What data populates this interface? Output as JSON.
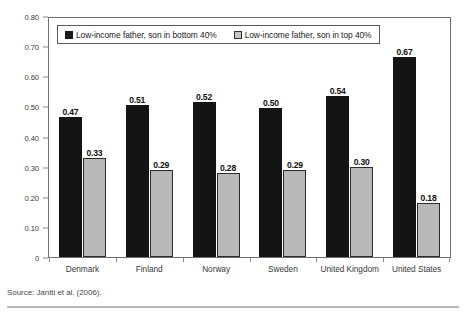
{
  "chart_data": {
    "type": "bar",
    "title": "",
    "subtitle": "",
    "xlabel": "",
    "ylabel": "",
    "categories": [
      "Denmark",
      "Finland",
      "Norway",
      "Sweden",
      "United Kingdom",
      "United States"
    ],
    "series": [
      {
        "name": "Low-income father, son in bottom 40%",
        "color": "#141414",
        "values": [
          0.47,
          0.51,
          0.52,
          0.5,
          0.54,
          0.67
        ],
        "labels": [
          "0.47",
          "0.51",
          "0.52",
          "0.50",
          "0.54",
          "0.67"
        ]
      },
      {
        "name": "Low-income father, son in top 40%",
        "color": "#b8b8b8",
        "values": [
          0.33,
          0.29,
          0.28,
          0.29,
          0.3,
          0.18
        ],
        "labels": [
          "0.33",
          "0.29",
          "0.28",
          "0.29",
          "0.30",
          "0.18"
        ]
      }
    ],
    "ylim": [
      0,
      0.8
    ],
    "yticks": [
      0.8,
      0.7,
      0.6,
      0.5,
      0.4,
      0.3,
      0.2,
      0.1,
      0
    ],
    "ytick_labels": [
      "0.80",
      "0.70",
      "0.60",
      "0.50",
      "0.40",
      "0.30",
      "0.20",
      "0.10",
      "0"
    ],
    "grid": false,
    "legend_position": "top-inside",
    "data_labels": true
  },
  "legend": {
    "entries": [
      {
        "label": "Low-income father, son in bottom 40%",
        "swatch": "dark-square-swatch"
      },
      {
        "label": "Low-income father, son in top 40%",
        "swatch": "light-square-swatch"
      }
    ]
  },
  "footer": {
    "source": "Source: Jantti et al. (2006)."
  }
}
